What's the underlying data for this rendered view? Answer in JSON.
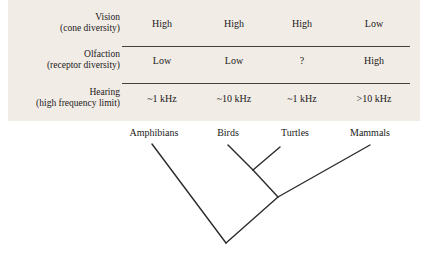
{
  "figure": {
    "panel_background": "#f2ece6",
    "line_color": "#2b2b2b",
    "rule_color": "#4a4038"
  },
  "table": {
    "rows": [
      {
        "label_line1": "Vision",
        "label_line2": "(cone diversity)",
        "values": [
          "High",
          "High",
          "High",
          "Low"
        ]
      },
      {
        "label_line1": "Olfaction",
        "label_line2": "(receptor diversity)",
        "values": [
          "Low",
          "Low",
          "?",
          "High"
        ]
      },
      {
        "label_line1": "Hearing",
        "label_line2": "(high frequency limit)",
        "values": [
          "~1 kHz",
          "~10 kHz",
          "~1 kHz",
          ">10 kHz"
        ]
      }
    ]
  },
  "cladogram": {
    "taxa": [
      {
        "name": "Amphibians"
      },
      {
        "name": "Birds"
      },
      {
        "name": "Turtles"
      },
      {
        "name": "Mammals"
      }
    ]
  }
}
